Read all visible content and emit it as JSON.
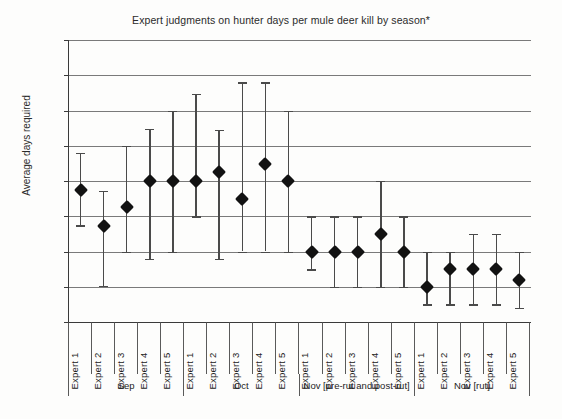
{
  "chart_data": {
    "type": "scatter",
    "title": "Expert judgments on hunter days per mule deer kill by season*",
    "xlabel": "",
    "ylabel": "Average days required",
    "ylim": [
      0,
      40
    ],
    "ytick_step": 5,
    "ytick_labels": [
      "40",
      "35",
      "30",
      "25",
      "20",
      "15",
      "10",
      "5",
      "0"
    ],
    "grid": "horizontal",
    "legend": "none",
    "error_bars": "vertical ranges with caps",
    "marker": "filled black diamond",
    "categories": [
      "Expert 1",
      "Expert 2",
      "Expert 3",
      "Expert 4",
      "Expert 5",
      "Expert 1",
      "Expert 2",
      "Expert 3",
      "Expert 4",
      "Expert 5",
      "Expert 1",
      "Expert 2",
      "Expert 3",
      "Expert 4",
      "Expert 5",
      "Expert 1",
      "Expert 2",
      "Expert 3",
      "Expert 4",
      "Expert 5"
    ],
    "groups": [
      {
        "label": "Sep",
        "span": 5
      },
      {
        "label": "Oct",
        "span": 5
      },
      {
        "label": "Nov [pre-rut and post-rut]",
        "span": 5
      },
      {
        "label": "Nov [rut]",
        "span": 5
      }
    ],
    "values": [
      18.7,
      13.6,
      16.3,
      20.0,
      20.0,
      20.0,
      21.3,
      17.5,
      22.4,
      20.0,
      10.0,
      10.0,
      10.0,
      12.5,
      10.0,
      5.0,
      7.5,
      7.5,
      7.5,
      6.0
    ],
    "lower": [
      13.7,
      5.1,
      10.0,
      9.0,
      10.0,
      15.0,
      9.0,
      10.0,
      10.0,
      10.0,
      7.5,
      5.0,
      5.0,
      5.0,
      5.0,
      2.5,
      2.5,
      2.5,
      2.5,
      2.0
    ],
    "upper": [
      24.0,
      18.6,
      25.0,
      27.4,
      30.0,
      32.4,
      27.3,
      34.0,
      34.0,
      30.0,
      15.0,
      15.0,
      15.0,
      20.0,
      15.0,
      10.0,
      10.0,
      12.5,
      12.5,
      10.0
    ],
    "points": [
      {
        "group": "Sep",
        "expert": "Expert 1",
        "value": 18.7,
        "low": 13.7,
        "high": 24.0
      },
      {
        "group": "Sep",
        "expert": "Expert 2",
        "value": 13.6,
        "low": 5.1,
        "high": 18.6
      },
      {
        "group": "Sep",
        "expert": "Expert 3",
        "value": 16.3,
        "low": 10.0,
        "high": 25.0
      },
      {
        "group": "Sep",
        "expert": "Expert 4",
        "value": 20.0,
        "low": 9.0,
        "high": 27.4
      },
      {
        "group": "Sep",
        "expert": "Expert 5",
        "value": 20.0,
        "low": 10.0,
        "high": 30.0
      },
      {
        "group": "Oct",
        "expert": "Expert 1",
        "value": 20.0,
        "low": 15.0,
        "high": 32.4
      },
      {
        "group": "Oct",
        "expert": "Expert 2",
        "value": 21.3,
        "low": 9.0,
        "high": 27.3
      },
      {
        "group": "Oct",
        "expert": "Expert 3",
        "value": 17.5,
        "low": 10.0,
        "high": 34.0
      },
      {
        "group": "Oct",
        "expert": "Expert 4",
        "value": 22.4,
        "low": 10.0,
        "high": 34.0
      },
      {
        "group": "Oct",
        "expert": "Expert 5",
        "value": 20.0,
        "low": 10.0,
        "high": 30.0
      },
      {
        "group": "Nov [pre-rut and post-rut]",
        "expert": "Expert 1",
        "value": 10.0,
        "low": 7.5,
        "high": 15.0
      },
      {
        "group": "Nov [pre-rut and post-rut]",
        "expert": "Expert 2",
        "value": 10.0,
        "low": 5.0,
        "high": 15.0
      },
      {
        "group": "Nov [pre-rut and post-rut]",
        "expert": "Expert 3",
        "value": 10.0,
        "low": 5.0,
        "high": 15.0
      },
      {
        "group": "Nov [pre-rut and post-rut]",
        "expert": "Expert 4",
        "value": 12.5,
        "low": 5.0,
        "high": 20.0
      },
      {
        "group": "Nov [pre-rut and post-rut]",
        "expert": "Expert 5",
        "value": 10.0,
        "low": 5.0,
        "high": 15.0
      },
      {
        "group": "Nov [rut]",
        "expert": "Expert 1",
        "value": 5.0,
        "low": 2.5,
        "high": 10.0
      },
      {
        "group": "Nov [rut]",
        "expert": "Expert 2",
        "value": 7.5,
        "low": 2.5,
        "high": 10.0
      },
      {
        "group": "Nov [rut]",
        "expert": "Expert 3",
        "value": 7.5,
        "low": 2.5,
        "high": 12.5
      },
      {
        "group": "Nov [rut]",
        "expert": "Expert 4",
        "value": 7.5,
        "low": 2.5,
        "high": 12.5
      },
      {
        "group": "Nov [rut]",
        "expert": "Expert 5",
        "value": 6.0,
        "low": 2.0,
        "high": 10.0
      }
    ],
    "colors": {
      "marker": "#121212",
      "error_bar": "#4a4a4a",
      "gridline": "#7a7a7a",
      "axis": "#3a3a3a",
      "text": "#2b2b2b",
      "background": "#fdfdfc"
    }
  }
}
